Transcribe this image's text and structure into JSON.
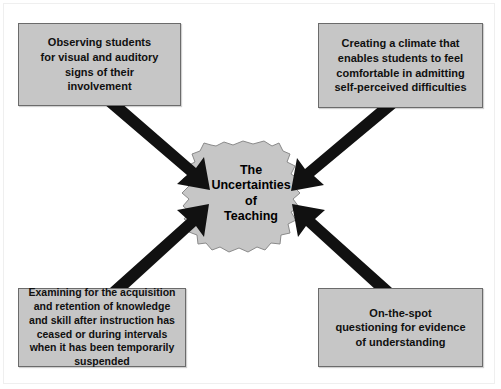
{
  "diagram": {
    "title": "The Uncertainties of Teaching",
    "center": {
      "label": "The\nUncertainties\nof\nTeaching",
      "shape": "jagged-starburst-blob",
      "fill_color": "#c6c6c6"
    },
    "palette": {
      "box_fill": "#c6c6c6",
      "box_border": "#6b6b6b",
      "arrow_color": "#111111",
      "background": "#ffffff",
      "text_color": "#101010"
    },
    "nodes": [
      {
        "id": "observing",
        "position": "top-left",
        "text": "Observing students\nfor visual and auditory\nsigns of their\ninvolvement"
      },
      {
        "id": "climate",
        "position": "top-right",
        "text": "Creating a climate that\nenables students to feel\ncomfortable in admitting\nself-perceived difficulties"
      },
      {
        "id": "examining",
        "position": "bottom-left",
        "text": "Examining for the acquisition\nand retention of knowledge\nand skill after instruction has\nceased or during intervals\nwhen it has been temporarily\nsuspended"
      },
      {
        "id": "onthespot",
        "position": "bottom-right",
        "text": "On-the-spot\nquestioning for evidence\nof understanding"
      }
    ],
    "arrows": [
      {
        "id": "arrow-observing-to-center",
        "from": "observing",
        "to": "center",
        "direction": "down-right"
      },
      {
        "id": "arrow-climate-to-center",
        "from": "climate",
        "to": "center",
        "direction": "down-left"
      },
      {
        "id": "arrow-examining-to-center",
        "from": "examining",
        "to": "center",
        "direction": "up-right"
      },
      {
        "id": "arrow-onthespot-to-center",
        "from": "onthespot",
        "to": "center",
        "direction": "up-left"
      }
    ]
  }
}
